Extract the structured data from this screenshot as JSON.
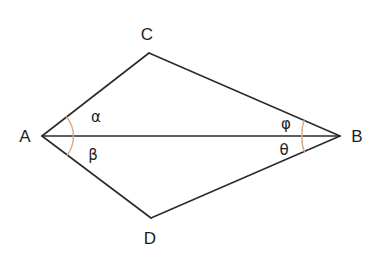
{
  "figure": {
    "background_color": "#ffffff",
    "line_color": "#2b2b2b",
    "arc_color": "#dda880",
    "text_color": "#1d1d1d"
  },
  "vertices": {
    "a": {
      "label": "A",
      "x": 42,
      "y": 136,
      "label_x": 25,
      "label_y": 142
    },
    "b": {
      "label": "B",
      "x": 340,
      "y": 136,
      "label_x": 352,
      "label_y": 142
    },
    "c": {
      "label": "C",
      "x": 149,
      "y": 53,
      "label_x": 142,
      "label_y": 40
    },
    "d": {
      "label": "D",
      "x": 151,
      "y": 218,
      "label_x": 144,
      "label_y": 243
    }
  },
  "angles": {
    "alpha": {
      "label": "α",
      "at_vertex": "A",
      "between": "AC and AB",
      "label_x": 90,
      "label_y": 122
    },
    "beta": {
      "label": "β",
      "at_vertex": "A",
      "between": "AB and AD",
      "label_x": 87,
      "label_y": 160
    },
    "phi": {
      "label": "φ",
      "at_vertex": "B",
      "between": "BC and BA",
      "label_x": 279,
      "label_y": 130
    },
    "theta": {
      "label": "θ",
      "at_vertex": "B",
      "between": "BA and BD",
      "label_x": 277,
      "label_y": 156
    }
  },
  "edges": [
    {
      "name": "edge-AC",
      "from": "A",
      "to": "C"
    },
    {
      "name": "edge-CB",
      "from": "C",
      "to": "B"
    },
    {
      "name": "edge-BD",
      "from": "B",
      "to": "D"
    },
    {
      "name": "edge-DA",
      "from": "D",
      "to": "A"
    },
    {
      "name": "diagonal-AB",
      "from": "A",
      "to": "B"
    }
  ]
}
